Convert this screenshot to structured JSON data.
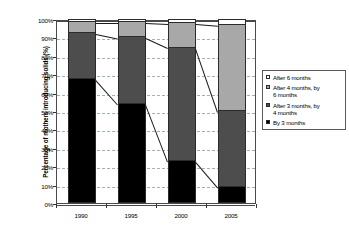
{
  "chart_data": {
    "type": "bar",
    "subtype": "stacked-100-percent",
    "title": "",
    "xlabel": "",
    "ylabel": "Percentage of mothers introducing solids (%)",
    "categories": [
      "1990",
      "1995",
      "2000",
      "2005"
    ],
    "ylim": [
      0,
      100
    ],
    "ytick_labels": [
      "0%",
      "10%",
      "20%",
      "30%",
      "40%",
      "50%",
      "60%",
      "70%",
      "80%",
      "90%",
      "100%"
    ],
    "ytick_values": [
      0,
      10,
      20,
      30,
      40,
      50,
      60,
      70,
      80,
      90,
      100
    ],
    "grid": "horizontal-dashed",
    "legend_position": "right",
    "series": [
      {
        "name": "After 6 months",
        "color": "#ffffff",
        "values": [
          1.0,
          1.0,
          1.5,
          2.5
        ]
      },
      {
        "name": "After 4 months, by 6 months",
        "color": "#a8a8a8",
        "values": [
          6.0,
          8.5,
          13.5,
          47.0
        ]
      },
      {
        "name": "After 3 months, by 4 months",
        "color": "#4d4d4d",
        "values": [
          25.0,
          36.0,
          61.5,
          41.0
        ]
      },
      {
        "name": "By 3 months",
        "color": "#000000",
        "values": [
          68.0,
          54.5,
          23.5,
          9.5
        ]
      }
    ],
    "cumulative_tops": {
      "by_3_months": [
        68.0,
        54.5,
        23.5,
        9.5
      ],
      "after_3_by_4_months": [
        93.0,
        90.5,
        85.0,
        50.5
      ],
      "after_4_by_6_months": [
        99.0,
        99.0,
        98.5,
        97.5
      ],
      "after_6_months": [
        100.0,
        100.0,
        100.0,
        100.0
      ]
    },
    "connector_lines": true
  },
  "axes": {
    "y_title": "Percentage of mothers introducing solids (%)",
    "y_ticks": [
      {
        "label": "100%",
        "value": 100
      },
      {
        "label": "90%",
        "value": 90
      },
      {
        "label": "80%",
        "value": 80
      },
      {
        "label": "70%",
        "value": 70
      },
      {
        "label": "60%",
        "value": 60
      },
      {
        "label": "50%",
        "value": 50
      },
      {
        "label": "40%",
        "value": 40
      },
      {
        "label": "30%",
        "value": 30
      },
      {
        "label": "20%",
        "value": 20
      },
      {
        "label": "10%",
        "value": 10
      },
      {
        "label": "0%",
        "value": 0
      }
    ],
    "x_ticks": [
      {
        "label": "1990"
      },
      {
        "label": "1995"
      },
      {
        "label": "2000"
      },
      {
        "label": "2005"
      }
    ]
  },
  "legend": {
    "items": [
      {
        "label": "After 6 months",
        "color": "#ffffff"
      },
      {
        "label": "After 4 months, by\n6 months",
        "color": "#a8a8a8"
      },
      {
        "label": "After 3 months, by\n4 months",
        "color": "#4d4d4d"
      },
      {
        "label": "By 3 months",
        "color": "#000000"
      }
    ]
  }
}
